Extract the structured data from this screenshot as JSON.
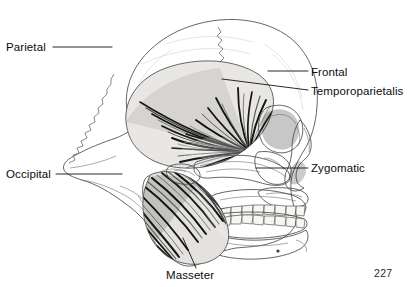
{
  "figure": {
    "type": "anatomical-illustration",
    "page_number": "227",
    "labels": [
      {
        "id": "parietal",
        "text": "Parietal",
        "side": "left",
        "text_x": 6,
        "text_y": 51,
        "anchor": "start",
        "line": [
          53,
          47,
          112,
          47
        ]
      },
      {
        "id": "frontal",
        "text": "Frontal",
        "side": "right",
        "text_x": 311,
        "text_y": 76,
        "anchor": "start",
        "line": [
          268,
          71,
          308,
          71
        ]
      },
      {
        "id": "temporoparietalis",
        "text": "Temporoparietalis",
        "side": "right",
        "text_x": 311,
        "text_y": 95,
        "anchor": "start",
        "line": [
          222,
          79,
          308,
          90
        ]
      },
      {
        "id": "occipital",
        "text": "Occipital",
        "side": "left",
        "text_x": 6,
        "text_y": 178,
        "anchor": "start",
        "line": [
          56,
          174,
          122,
          174
        ]
      },
      {
        "id": "zygomatic",
        "text": "Zygomatic",
        "side": "right",
        "text_x": 311,
        "text_y": 172,
        "anchor": "start",
        "line": [
          256,
          168,
          308,
          168
        ]
      },
      {
        "id": "masseter",
        "text": "Masseter",
        "side": "bottom",
        "text_x": 166,
        "text_y": 278,
        "anchor": "start",
        "line": [
          196,
          268,
          183,
          238
        ]
      }
    ],
    "structures": [
      "cranial vault",
      "coronal suture",
      "lambdoid suture",
      "temporalis muscle fan",
      "masseter muscle",
      "orbit",
      "zygomatic arch",
      "nasal aperture",
      "maxilla",
      "mandible",
      "upper teeth row",
      "lower teeth row",
      "mastoid process",
      "external auditory meatus"
    ],
    "colors": {
      "background": "#ffffff",
      "bone": "#f3f1ee",
      "outline": "#4a4a4a",
      "muscle_dark": "#1d1d1d",
      "muscle_light": "#d8d6d2",
      "label_text": "#0b0b0b",
      "leader_line": "#111111"
    }
  }
}
